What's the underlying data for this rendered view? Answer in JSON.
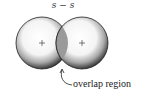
{
  "diagram": {
    "title": "s − s",
    "left_orbital": {
      "sign": "+"
    },
    "right_orbital": {
      "sign": "+"
    },
    "overlap_label": "overlap region",
    "colors": {
      "outline": "#222222",
      "overlap_fill": "#9a9a9a",
      "stipple": "#333333"
    }
  }
}
